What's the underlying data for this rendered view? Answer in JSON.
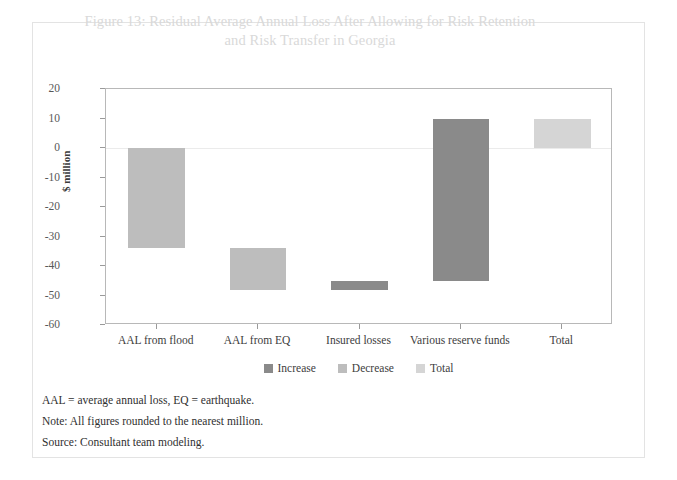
{
  "figure": {
    "title": "Figure 13: Residual Average Annual Loss After Allowing for Risk Retention and Risk Transfer in Georgia",
    "title_line1": "Figure 13: Residual Average Annual Loss After Allowing for Risk Retention",
    "title_line2": "and Risk Transfer in Georgia"
  },
  "notes": [
    "AAL = average annual loss, EQ = earthquake.",
    "Note: All figures rounded to the nearest million.",
    "Source: Consultant team modeling."
  ],
  "colors": {
    "increase": "#8a8a8a",
    "decrease": "#bdbdbd",
    "total": "#d5d5d5",
    "axis": "#b8b8b8",
    "title": "#d9d9d9"
  },
  "chart_data": {
    "type": "bar",
    "chart_style": "waterfall",
    "title": "Figure 13: Residual Average Annual Loss After Allowing for Risk Retention and Risk Transfer in Georgia",
    "xlabel": "",
    "ylabel": "$ million",
    "ylim": [
      -60,
      20
    ],
    "yticks": [
      20,
      10,
      0,
      -10,
      -20,
      -30,
      -40,
      -50,
      -60
    ],
    "ytick_labels": [
      "20",
      "10",
      "0",
      "-10",
      "-20",
      "-30",
      "-40",
      "-50",
      "-60"
    ],
    "grid": false,
    "legend_position": "bottom",
    "categories": [
      "AAL from flood",
      "AAL from EQ",
      "Insured losses",
      "Various reserve funds",
      "Total"
    ],
    "legend": [
      {
        "label": "Increase",
        "color": "#8a8a8a"
      },
      {
        "label": "Decrease",
        "color": "#bdbdbd"
      },
      {
        "label": "Total",
        "color": "#d5d5d5"
      }
    ],
    "bars": [
      {
        "category": "AAL from flood",
        "start": 0,
        "end": -34,
        "value": -34,
        "kind": "Decrease",
        "color": "#bdbdbd"
      },
      {
        "category": "AAL from EQ",
        "start": -34,
        "end": -48,
        "value": -14,
        "kind": "Decrease",
        "color": "#bdbdbd"
      },
      {
        "category": "Insured losses",
        "start": -48,
        "end": -45,
        "value": 3,
        "kind": "Increase",
        "color": "#8a8a8a"
      },
      {
        "category": "Various reserve funds",
        "start": -45,
        "end": 10,
        "value": 55,
        "kind": "Increase",
        "color": "#8a8a8a"
      },
      {
        "category": "Total",
        "start": 0,
        "end": 10,
        "value": 10,
        "kind": "Total",
        "color": "#d5d5d5"
      }
    ]
  }
}
